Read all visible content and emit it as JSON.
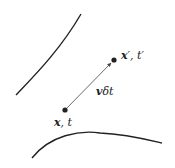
{
  "diagram": {
    "start_point": {
      "label_x": "x",
      "label_sep": ", ",
      "label_t": "t"
    },
    "end_point": {
      "label_x": "x",
      "prime": "′",
      "label_sep": ", ",
      "label_t": "t",
      "prime_t": "′"
    },
    "vector": {
      "label_v": "v",
      "label_rest": "δt"
    },
    "colors": {
      "stroke": "#222222",
      "arrow": "#444444"
    }
  }
}
